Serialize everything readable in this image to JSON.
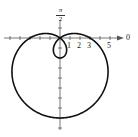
{
  "chart_data": {
    "type": "line",
    "title": "",
    "coordinate_system": "polar",
    "equation": "r = 3 - 5 sin(theta)",
    "curve": "limacon with inner loop",
    "axis_labels": {
      "polar_axis": "0",
      "vertical_axis": "π/2"
    },
    "tick_labels": [
      "1",
      "2",
      "3",
      "5"
    ],
    "key_points": [
      {
        "theta": "0",
        "r": 3,
        "x": 3,
        "y": 0
      },
      {
        "theta": "π/2",
        "r": -2,
        "x": 0,
        "y": -2
      },
      {
        "theta": "π",
        "r": 3,
        "x": -3,
        "y": 0
      },
      {
        "theta": "3π/2",
        "r": 8,
        "x": 0,
        "y": -8
      }
    ],
    "xlim": [
      -5,
      6
    ],
    "ylim": [
      -9,
      3
    ],
    "grid": false,
    "legend": null
  },
  "labels": {
    "polar_axis": "0",
    "pi_num": "π",
    "pi_den": "2",
    "t1": "1",
    "t2": "2",
    "t3": "3",
    "t5": "5"
  }
}
